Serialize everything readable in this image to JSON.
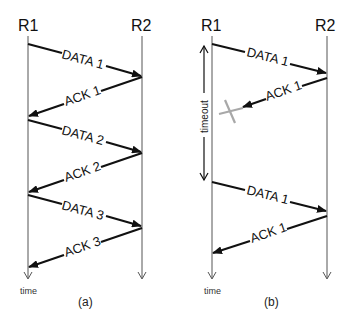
{
  "panel_a": {
    "caption": "(a)",
    "left_node": "R1",
    "right_node": "R2",
    "time_label": "time",
    "messages": [
      {
        "label": "DATA 1",
        "direction": "R1->R2"
      },
      {
        "label": "ACK 1",
        "direction": "R2->R1"
      },
      {
        "label": "DATA 2",
        "direction": "R1->R2"
      },
      {
        "label": "ACK 2",
        "direction": "R2->R1"
      },
      {
        "label": "DATA 3",
        "direction": "R1->R2"
      },
      {
        "label": "ACK 3",
        "direction": "R2->R1"
      }
    ]
  },
  "panel_b": {
    "caption": "(b)",
    "left_node": "R1",
    "right_node": "R2",
    "time_label": "time",
    "timeout_label": "timeout",
    "lost_marker": "X",
    "messages": [
      {
        "label": "DATA 1",
        "direction": "R1->R2"
      },
      {
        "label": "ACK 1",
        "direction": "R2->R1",
        "status": "lost"
      },
      {
        "label": "DATA 1",
        "direction": "R1->R2",
        "status": "retransmission"
      },
      {
        "label": "ACK 1",
        "direction": "R2->R1"
      }
    ]
  },
  "colors": {
    "arrow": "#111111",
    "lifeline": "#555555",
    "lost_marker": "#a8a8a8"
  }
}
